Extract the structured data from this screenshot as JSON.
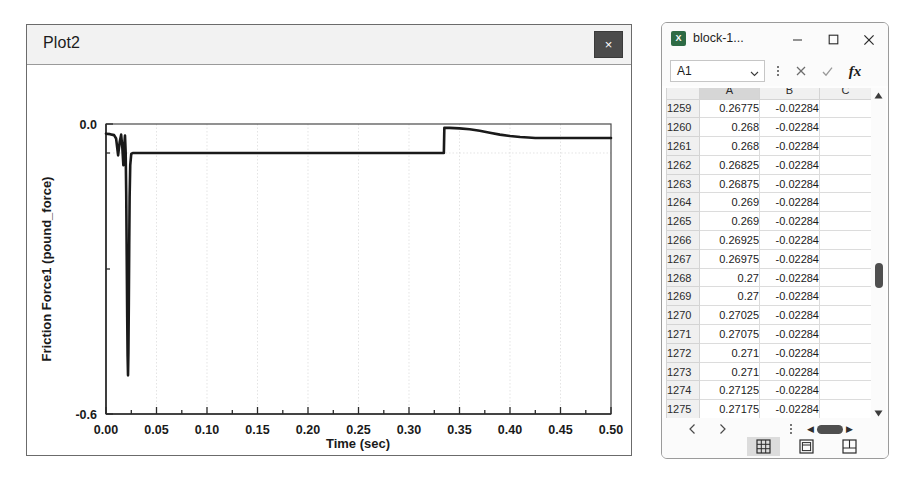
{
  "plot_window": {
    "title": "Plot2",
    "close_label": "×",
    "close_icon": "close-icon"
  },
  "chart_data": {
    "type": "line",
    "title": "",
    "xlabel": "Time (sec)",
    "ylabel": "Friction Force1 (pound_force)",
    "xlim": [
      0.0,
      0.5
    ],
    "ylim": [
      -0.6,
      0.0
    ],
    "xticks": [
      "0.00",
      "0.05",
      "0.10",
      "0.15",
      "0.20",
      "0.25",
      "0.30",
      "0.35",
      "0.40",
      "0.45",
      "0.50"
    ],
    "xtick_values": [
      0.0,
      0.05,
      0.1,
      0.15,
      0.2,
      0.25,
      0.3,
      0.35,
      0.4,
      0.45,
      0.5
    ],
    "yticks": [
      "0.0",
      "-0.6"
    ],
    "ytick_values": [
      0.0,
      -0.6
    ],
    "grid": true,
    "legend": "none",
    "series": [
      {
        "name": "Friction Force1",
        "color": "#1a1a1a",
        "x": [
          0.0,
          0.004,
          0.008,
          0.01,
          0.012,
          0.0135,
          0.015,
          0.0162,
          0.0172,
          0.018,
          0.0188,
          0.0195,
          0.02,
          0.0205,
          0.021,
          0.0214,
          0.0218,
          0.0222,
          0.0226,
          0.023,
          0.0234,
          0.024,
          0.025,
          0.0265,
          0.03,
          0.04,
          0.06,
          0.1,
          0.15,
          0.2,
          0.25,
          0.3,
          0.33,
          0.3345,
          0.335,
          0.34,
          0.35,
          0.36,
          0.37,
          0.38,
          0.39,
          0.4,
          0.41,
          0.418,
          0.425,
          0.44,
          0.46,
          0.48,
          0.5
        ],
        "y": [
          -0.02,
          -0.021,
          -0.023,
          -0.03,
          -0.065,
          -0.038,
          -0.022,
          -0.05,
          -0.085,
          -0.046,
          -0.024,
          -0.06,
          -0.14,
          -0.27,
          -0.4,
          -0.48,
          -0.52,
          -0.47,
          -0.37,
          -0.25,
          -0.15,
          -0.085,
          -0.062,
          -0.06,
          -0.06,
          -0.06,
          -0.06,
          -0.06,
          -0.06,
          -0.06,
          -0.06,
          -0.06,
          -0.06,
          -0.06,
          -0.008,
          -0.008,
          -0.009,
          -0.011,
          -0.014,
          -0.018,
          -0.022,
          -0.025,
          -0.027,
          -0.028,
          -0.029,
          -0.029,
          -0.029,
          -0.029,
          -0.029
        ]
      }
    ]
  },
  "excel_window": {
    "title": "block-1...",
    "app_icon": "excel-icon",
    "app_icon_glyph": "X",
    "minimize_label": "Minimize",
    "maximize_label": "Maximize",
    "close_label": "Close",
    "formula_bar": {
      "namebox_value": "A1",
      "namebox_chevron": "chevron-down-icon",
      "more_icon": "more-vertical-icon",
      "cancel_icon": "cancel-icon",
      "enter_icon": "check-icon",
      "function_label": "fx"
    },
    "grid": {
      "columns": [
        "A",
        "B",
        "C"
      ],
      "selected_column": "A",
      "rows": [
        {
          "num": "1259",
          "a": "0.26775",
          "b": "-0.02284",
          "c": ""
        },
        {
          "num": "1260",
          "a": "0.268",
          "b": "-0.02284",
          "c": ""
        },
        {
          "num": "1261",
          "a": "0.268",
          "b": "-0.02284",
          "c": ""
        },
        {
          "num": "1262",
          "a": "0.26825",
          "b": "-0.02284",
          "c": ""
        },
        {
          "num": "1263",
          "a": "0.26875",
          "b": "-0.02284",
          "c": ""
        },
        {
          "num": "1264",
          "a": "0.269",
          "b": "-0.02284",
          "c": ""
        },
        {
          "num": "1265",
          "a": "0.269",
          "b": "-0.02284",
          "c": ""
        },
        {
          "num": "1266",
          "a": "0.26925",
          "b": "-0.02284",
          "c": ""
        },
        {
          "num": "1267",
          "a": "0.26975",
          "b": "-0.02284",
          "c": ""
        },
        {
          "num": "1268",
          "a": "0.27",
          "b": "-0.02284",
          "c": ""
        },
        {
          "num": "1269",
          "a": "0.27",
          "b": "-0.02284",
          "c": ""
        },
        {
          "num": "1270",
          "a": "0.27025",
          "b": "-0.02284",
          "c": ""
        },
        {
          "num": "1271",
          "a": "0.27075",
          "b": "-0.02284",
          "c": ""
        },
        {
          "num": "1272",
          "a": "0.271",
          "b": "-0.02284",
          "c": ""
        },
        {
          "num": "1273",
          "a": "0.271",
          "b": "-0.02284",
          "c": ""
        },
        {
          "num": "1274",
          "a": "0.27125",
          "b": "-0.02284",
          "c": ""
        },
        {
          "num": "1275",
          "a": "0.27175",
          "b": "-0.02284",
          "c": ""
        },
        {
          "num": "1276",
          "a": "0.272",
          "b": "-0.02284",
          "c": ""
        }
      ]
    },
    "scrollbar": {
      "up_icon": "scroll-up-icon",
      "down_icon": "scroll-down-icon"
    },
    "status_bar": {
      "prev_sheet_icon": "chevron-left-icon",
      "next_sheet_icon": "chevron-right-icon",
      "more_icon": "more-vertical-icon",
      "view_normal": "normal-view-icon",
      "view_page_layout": "page-layout-view-icon",
      "view_page_break": "page-break-view-icon"
    }
  }
}
